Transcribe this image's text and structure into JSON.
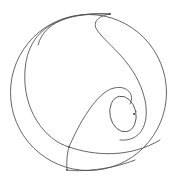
{
  "diagram": {
    "background": "#ffffff",
    "stroke_color": "#555555",
    "stroke_width": 0.9,
    "outer_circle": {
      "cx": 88.5,
      "cy": 92.5,
      "r": 78
    },
    "inner_ellipse": {
      "cx": 123,
      "cy": 114,
      "rx": 13,
      "ry": 18,
      "rotate": -12
    },
    "center_point": {
      "cx": 134,
      "cy": 114,
      "r": 0.9
    },
    "vertices": [
      {
        "cx": 110,
        "cy": 14
      },
      {
        "cx": 69,
        "cy": 147
      },
      {
        "cx": 67,
        "cy": 170
      }
    ],
    "curves": {
      "crescent": "M110,14 C60,12 28,28 25,70 C22,110 45,140 69,147 C95,156 130,158 160,140",
      "inner_arc": "M110,14 C80,12 45,18 38,45",
      "s_curve": "M110,14 C98,16 92,22 97,30 C108,46 136,62 145,100 C150,125 140,142 120,140",
      "loop_curve": "M67,170 C66,160 68,150 69,147 C78,126 96,92 114,88 C128,85 135,95 130,104",
      "lower_crescent": "M67,170 C80,172 110,170 135,160"
    }
  }
}
